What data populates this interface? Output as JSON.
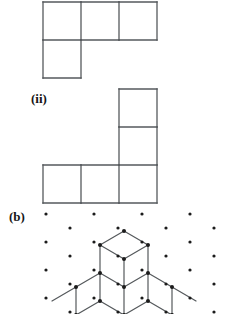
{
  "page": {
    "width": 230,
    "height": 314,
    "background": "#ffffff",
    "ink": "#55595c",
    "dot_color": "#1b1b1b",
    "text_color": "#161616"
  },
  "labels": {
    "figure_ii": "(ii)",
    "part_b": "(b)"
  },
  "figures": [
    {
      "name": "polyomino-i",
      "type": "square-grid-shape",
      "cell_size": 38,
      "origin": {
        "x": 43,
        "y": 2
      },
      "cells": [
        {
          "col": 0,
          "row": 0
        },
        {
          "col": 1,
          "row": 0
        },
        {
          "col": 2,
          "row": 0
        },
        {
          "col": 0,
          "row": 1
        }
      ],
      "description": "L-shaped tetromino: three squares in a top row with one square below the leftmost"
    },
    {
      "name": "polyomino-ii",
      "type": "square-grid-shape",
      "cell_size": 38,
      "origin": {
        "x": 43,
        "y": 89
      },
      "cells": [
        {
          "col": 2,
          "row": 0
        },
        {
          "col": 2,
          "row": 1
        },
        {
          "col": 0,
          "row": 2
        },
        {
          "col": 1,
          "row": 2
        },
        {
          "col": 2,
          "row": 2
        }
      ],
      "description": "L-shaped pentomino: two squares stacked above the rightmost of a bottom row of three"
    }
  ],
  "isometric": {
    "name": "isometric-dot-grid",
    "dot_radius": 1.6,
    "dot_color": "#1b1b1b",
    "grid": {
      "origin_x": 46,
      "origin_y": 214,
      "dx": 24,
      "dy": 14,
      "row_step": 28,
      "columns": 7,
      "rows": 5
    },
    "solid": {
      "name": "cube-stack",
      "description": "Stacked isometric cubes drawn on the triangular dot lattice",
      "unit": {
        "dx": 24,
        "dy": 14,
        "dz": 28
      },
      "apex": {
        "x": 124,
        "y": 231
      },
      "vertex_color": "#1b1b1b",
      "edge_color": "#55595c"
    }
  }
}
